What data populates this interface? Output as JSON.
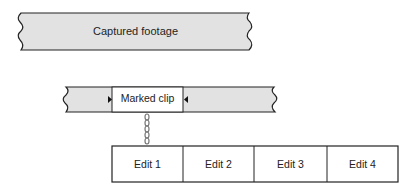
{
  "diagram": {
    "captured": {
      "label": "Captured footage"
    },
    "marked_clip": {
      "label": "Marked clip"
    },
    "edits": [
      "Edit 1",
      "Edit 2",
      "Edit 3",
      "Edit 4"
    ],
    "colors": {
      "strip_fill": "#e2e2e2",
      "stroke": "#222222",
      "clip_fill": "#ffffff"
    }
  }
}
